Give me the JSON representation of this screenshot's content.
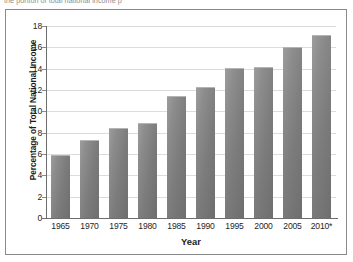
{
  "caption": {
    "text": "the portion of total national income p"
  },
  "chart_data": {
    "type": "bar",
    "title": "",
    "subtitle": "",
    "xlabel": "Year",
    "ylabel": "Percentage of Total National Income",
    "categories": [
      "1965",
      "1970",
      "1975",
      "1980",
      "1985",
      "1990",
      "1995",
      "2000",
      "2005",
      "2010*"
    ],
    "values": [
      5.9,
      7.3,
      8.4,
      8.9,
      11.4,
      12.3,
      14.1,
      14.2,
      16.0,
      17.2
    ],
    "ylim": [
      0,
      18
    ],
    "ytick_labels": [
      "0",
      "2",
      "4",
      "6",
      "8",
      "10",
      "12",
      "14",
      "16",
      "18"
    ],
    "ytick_values": [
      0,
      2,
      4,
      6,
      8,
      10,
      12,
      14,
      16,
      18
    ],
    "grid": "horizontal",
    "legend": "none",
    "annotations": [
      "* 2010 value marked with asterisk"
    ],
    "series": [
      {
        "name": "Percentage of Total National Income",
        "values": [
          5.9,
          7.3,
          8.4,
          8.9,
          11.4,
          12.3,
          14.1,
          14.2,
          16.0,
          17.2
        ]
      }
    ]
  },
  "colors": {
    "bar_light": "#9d9d9d",
    "bar_dark": "#6e6e6e",
    "grid": "#dcdcdc",
    "axis": "#6e6e6e",
    "frame": "#8a8a8a",
    "text": "#1f1f1f"
  }
}
